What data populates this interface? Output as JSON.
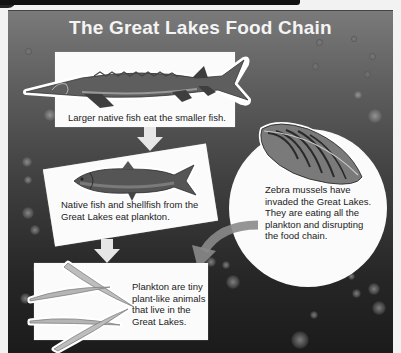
{
  "title": "The Great Lakes Food Chain",
  "colors": {
    "panel_top": "#7a7a7a",
    "panel_bottom": "#1b1b1b",
    "card": "#fbfbfb",
    "title_text": "#f4f4f4",
    "body_text": "#222222",
    "arrow": "#e6e6e6",
    "curved_arrow": "#8a8a8a"
  },
  "stages": [
    {
      "id": "large-fish",
      "organism": "sturgeon",
      "caption": "Larger native fish eat the smaller fish."
    },
    {
      "id": "native-fish",
      "organism": "fish",
      "caption_lines": [
        "Native fish and shellfish from the",
        "Great Lakes eat plankton."
      ]
    },
    {
      "id": "plankton",
      "organism": "plankton",
      "caption_lines": [
        "Plankton are tiny",
        "plant-like animals",
        "that live in the",
        "Great Lakes."
      ]
    }
  ],
  "invader": {
    "organism": "zebra mussel",
    "caption_lines": [
      "Zebra mussels have",
      "invaded the Great Lakes.",
      "They are eating all the",
      "plankton and disrupting",
      "the food chain."
    ]
  },
  "flow": [
    {
      "from": "large-fish",
      "to": "native-fish",
      "type": "straight-arrow"
    },
    {
      "from": "native-fish",
      "to": "plankton",
      "type": "straight-arrow"
    },
    {
      "from": "invader",
      "to": "plankton",
      "type": "curved-arrow"
    }
  ]
}
